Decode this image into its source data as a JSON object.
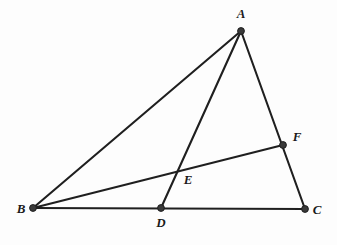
{
  "figure": {
    "kind": "euclidean-geometry-diagram",
    "background_color": "#fdfdfd",
    "stroke_color": "#1f1f1f",
    "label_color": "#1a1a1a",
    "point_fill_color": "#3a3a3a",
    "line_width": 2.1,
    "point_radius": 3.4,
    "label_font_size": 13
  },
  "points": {
    "A": {
      "label": "A",
      "x": 241,
      "y": 31,
      "marked": true,
      "label_x": 241,
      "label_y": 18,
      "anchor": "middle"
    },
    "B": {
      "label": "B",
      "x": 33,
      "y": 208,
      "marked": true,
      "label_x": 21,
      "label_y": 213,
      "anchor": "middle"
    },
    "C": {
      "label": "C",
      "x": 305,
      "y": 209,
      "marked": true,
      "label_x": 317,
      "label_y": 214,
      "anchor": "middle"
    },
    "D": {
      "label": "D",
      "x": 161,
      "y": 208,
      "marked": true,
      "label_x": 161,
      "label_y": 227,
      "anchor": "middle"
    },
    "E": {
      "label": "E",
      "x": 178,
      "y": 173,
      "marked": false,
      "label_x": 188,
      "label_y": 184,
      "anchor": "middle"
    },
    "F": {
      "label": "F",
      "x": 283,
      "y": 145,
      "marked": true,
      "label_x": 297,
      "label_y": 141,
      "anchor": "middle"
    }
  },
  "segments": [
    {
      "name": "segment-AB",
      "from": "A",
      "to": "B"
    },
    {
      "name": "segment-AC",
      "from": "A",
      "to": "C"
    },
    {
      "name": "segment-AD",
      "from": "A",
      "to": "D"
    },
    {
      "name": "segment-BC",
      "from": "B",
      "to": "C"
    },
    {
      "name": "segment-BF",
      "from": "B",
      "to": "F"
    }
  ],
  "chart_data": {
    "type": "diagram",
    "title": "",
    "vertices": [
      "A",
      "B",
      "C"
    ],
    "interior_points": [
      "D",
      "E",
      "F"
    ],
    "edges": [
      "AB",
      "AC",
      "BC"
    ],
    "cevians": [
      "AD",
      "BF"
    ],
    "intersection": {
      "point": "E",
      "of": [
        "AD",
        "BF"
      ]
    },
    "point_on_segment": [
      {
        "point": "D",
        "segment": "BC"
      },
      {
        "point": "F",
        "segment": "AC"
      },
      {
        "point": "E",
        "segment": "AD"
      }
    ]
  }
}
